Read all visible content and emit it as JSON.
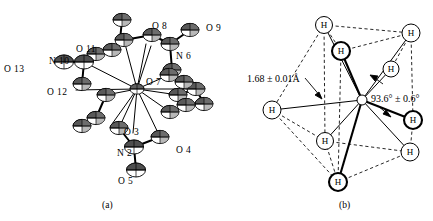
{
  "figure": {
    "background": "#ffffff",
    "ink": "#000000",
    "panels": [
      {
        "id": "a",
        "caption": "(a)",
        "type": "ortep-thermal-ellipsoid-plot",
        "atom_labels": [
          {
            "text": "O 13",
            "x": 4,
            "y": 64
          },
          {
            "text": "N 10",
            "x": 49,
            "y": 56
          },
          {
            "text": "O 11",
            "x": 76,
            "y": 44
          },
          {
            "text": "O 12",
            "x": 47,
            "y": 87
          },
          {
            "text": "O 8",
            "x": 152,
            "y": 21
          },
          {
            "text": "O 9",
            "x": 206,
            "y": 23
          },
          {
            "text": "N 6",
            "x": 176,
            "y": 51
          },
          {
            "text": "O 7",
            "x": 146,
            "y": 77
          },
          {
            "text": "O 3",
            "x": 124,
            "y": 127
          },
          {
            "text": "O 4",
            "x": 176,
            "y": 145
          },
          {
            "text": "N 2",
            "x": 117,
            "y": 148
          },
          {
            "text": "O 5",
            "x": 118,
            "y": 176
          }
        ]
      },
      {
        "id": "b",
        "caption": "(b)",
        "type": "hydrogen-coordination-polyhedron",
        "annotations": [
          {
            "name": "bond-length",
            "text": "1.68 ± 0.01Å",
            "x": 247,
            "y": 73
          },
          {
            "name": "bond-angle",
            "text": "93.6° ± 0.6°",
            "x": 371,
            "y": 93
          }
        ],
        "hydrogen_label": "H",
        "hydrogen_atoms": [
          {
            "cx": 324,
            "cy": 25,
            "r": 8.5,
            "bold": false
          },
          {
            "cx": 341,
            "cy": 51,
            "r": 9.0,
            "bold": true
          },
          {
            "cx": 411,
            "cy": 33,
            "r": 9.0,
            "bold": false
          },
          {
            "cx": 391,
            "cy": 69,
            "r": 8.0,
            "bold": false
          },
          {
            "cx": 272,
            "cy": 110,
            "r": 9.0,
            "bold": false
          },
          {
            "cx": 413,
            "cy": 120,
            "r": 9.0,
            "bold": true
          },
          {
            "cx": 325,
            "cy": 141,
            "r": 8.5,
            "bold": false
          },
          {
            "cx": 410,
            "cy": 152,
            "r": 9.0,
            "bold": false
          },
          {
            "cx": 338,
            "cy": 182,
            "r": 9.0,
            "bold": true
          }
        ],
        "central_atom": {
          "cx": 362,
          "cy": 100,
          "r": 5.0
        }
      }
    ],
    "captions": [
      {
        "text": "(a)",
        "x": 102,
        "y": 200
      },
      {
        "text": "(b)",
        "x": 339,
        "y": 200
      }
    ]
  }
}
